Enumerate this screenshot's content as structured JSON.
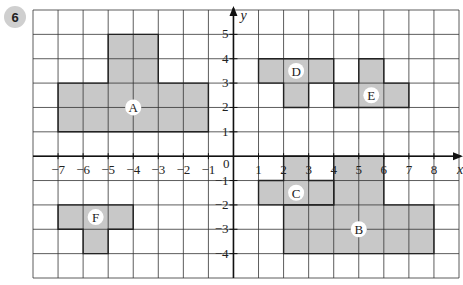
{
  "question_number": "6",
  "grid": {
    "x_min": -8,
    "x_max": 9,
    "y_min": -5,
    "y_max": 6
  },
  "axes": {
    "x_label": "x",
    "y_label": "y",
    "origin_label": "0",
    "x_ticks": [
      -7,
      -6,
      -5,
      -4,
      -3,
      -2,
      -1,
      1,
      2,
      3,
      4,
      5,
      6,
      7,
      8
    ],
    "y_ticks": [
      5,
      4,
      3,
      2,
      1,
      -1,
      -2,
      -3,
      -4
    ]
  },
  "colors": {
    "fill": "#c8c8c8",
    "grid": "#333333",
    "outline": "#222222"
  },
  "shapes": [
    {
      "label": "A",
      "points": [
        [
          -7,
          1
        ],
        [
          -1,
          1
        ],
        [
          -1,
          3
        ],
        [
          -3,
          3
        ],
        [
          -3,
          5
        ],
        [
          -5,
          5
        ],
        [
          -5,
          3
        ],
        [
          -7,
          3
        ]
      ],
      "label_pos": [
        -4,
        2
      ]
    },
    {
      "label": "B",
      "points": [
        [
          4,
          0
        ],
        [
          6,
          0
        ],
        [
          6,
          -2
        ],
        [
          8,
          -2
        ],
        [
          8,
          -4
        ],
        [
          2,
          -4
        ],
        [
          2,
          -2
        ],
        [
          4,
          -2
        ]
      ],
      "label_pos": [
        5,
        -3
      ]
    },
    {
      "label": "C",
      "points": [
        [
          2,
          0
        ],
        [
          3,
          0
        ],
        [
          3,
          -1
        ],
        [
          4,
          -1
        ],
        [
          4,
          -2
        ],
        [
          1,
          -2
        ],
        [
          1,
          -1
        ],
        [
          2,
          -1
        ]
      ],
      "label_pos": [
        2.5,
        -1.5
      ]
    },
    {
      "label": "D",
      "points": [
        [
          1,
          4
        ],
        [
          4,
          4
        ],
        [
          4,
          3
        ],
        [
          3,
          3
        ],
        [
          3,
          2
        ],
        [
          2,
          2
        ],
        [
          2,
          3
        ],
        [
          1,
          3
        ]
      ],
      "label_pos": [
        2.5,
        3.5
      ]
    },
    {
      "label": "E",
      "points": [
        [
          5,
          4
        ],
        [
          6,
          4
        ],
        [
          6,
          3
        ],
        [
          7,
          3
        ],
        [
          7,
          2
        ],
        [
          4,
          2
        ],
        [
          4,
          3
        ],
        [
          5,
          3
        ]
      ],
      "label_pos": [
        5.5,
        2.5
      ]
    },
    {
      "label": "F",
      "points": [
        [
          -7,
          -2
        ],
        [
          -4,
          -2
        ],
        [
          -4,
          -3
        ],
        [
          -5,
          -3
        ],
        [
          -5,
          -4
        ],
        [
          -6,
          -4
        ],
        [
          -6,
          -3
        ],
        [
          -7,
          -3
        ]
      ],
      "label_pos": [
        -5.5,
        -2.5
      ]
    }
  ]
}
